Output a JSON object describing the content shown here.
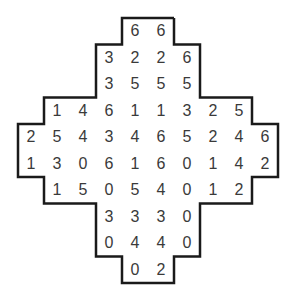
{
  "puzzle": {
    "grid_origin": [
      18,
      18
    ],
    "cell_size": [
      26,
      26.5
    ],
    "outline_color": "#1a1a1a",
    "rows": [
      {
        "start_col": 4,
        "values": [
          "6",
          "6"
        ]
      },
      {
        "start_col": 3,
        "values": [
          "3",
          "2",
          "2",
          "6"
        ]
      },
      {
        "start_col": 3,
        "values": [
          "3",
          "5",
          "5",
          "5"
        ]
      },
      {
        "start_col": 1,
        "values": [
          "1",
          "4",
          "6",
          "1",
          "1",
          "3",
          "2",
          "5"
        ]
      },
      {
        "start_col": 0,
        "values": [
          "2",
          "5",
          "4",
          "3",
          "4",
          "6",
          "5",
          "2",
          "4",
          "6"
        ]
      },
      {
        "start_col": 0,
        "values": [
          "1",
          "3",
          "0",
          "6",
          "1",
          "6",
          "0",
          "1",
          "4",
          "2"
        ]
      },
      {
        "start_col": 1,
        "values": [
          "1",
          "5",
          "0",
          "5",
          "4",
          "0",
          "1",
          "2"
        ]
      },
      {
        "start_col": 3,
        "values": [
          "3",
          "3",
          "3",
          "0"
        ]
      },
      {
        "start_col": 3,
        "values": [
          "0",
          "4",
          "4",
          "0"
        ]
      },
      {
        "start_col": 4,
        "values": [
          "0",
          "2"
        ]
      }
    ]
  }
}
